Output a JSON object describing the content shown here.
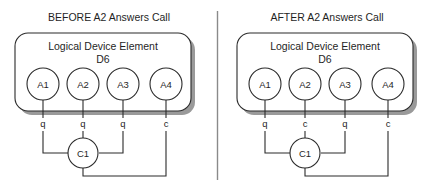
{
  "figure": {
    "background_color": "#ffffff",
    "line_color": "#2b2b2b",
    "shadow_color": "#9a9a9a",
    "divider_color": "#8a8a8a"
  },
  "divider": {
    "name": "panel-divider"
  },
  "panels": [
    {
      "id": "before",
      "title": "BEFORE A2 Answers Call",
      "container": {
        "title_line1": "Logical Device Element",
        "title_line2": "D6"
      },
      "nodes": [
        {
          "label": "A1",
          "port": "q"
        },
        {
          "label": "A2",
          "port": "q"
        },
        {
          "label": "A3",
          "port": "q"
        },
        {
          "label": "A4",
          "port": "c"
        }
      ],
      "controller": {
        "label": "C1"
      }
    },
    {
      "id": "after",
      "title": "AFTER A2 Answers Call",
      "container": {
        "title_line1": "Logical Device Element",
        "title_line2": "D6"
      },
      "nodes": [
        {
          "label": "A1",
          "port": "q"
        },
        {
          "label": "A2",
          "port": "c"
        },
        {
          "label": "A3",
          "port": "q"
        },
        {
          "label": "A4",
          "port": "c"
        }
      ],
      "controller": {
        "label": "C1"
      }
    }
  ]
}
